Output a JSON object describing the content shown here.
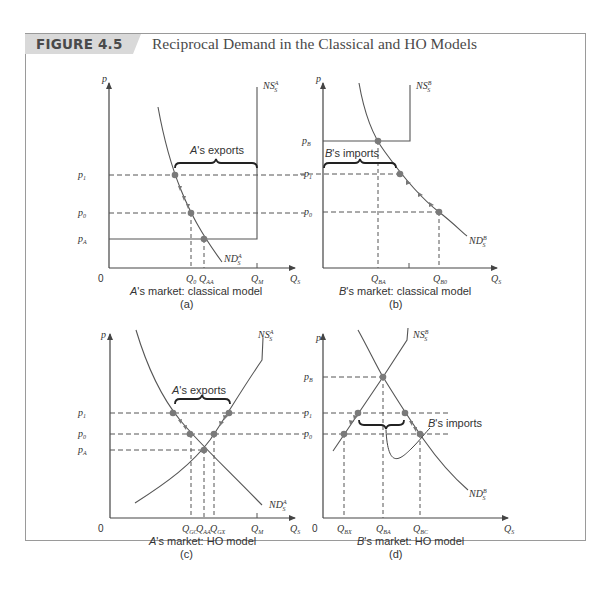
{
  "figure": {
    "number": "FIGURE 4.5",
    "title": "Reciprocal Demand in the Classical and HO Models"
  },
  "panels": [
    {
      "id": "a",
      "caption": "A's market: classical model",
      "caption_prefix": "A",
      "caption_rest": "'s market: classical model",
      "letter": "(a)",
      "y_axis": "p",
      "x_axis": "Q_S",
      "origin": "0",
      "price_labels": [
        "p1",
        "p0",
        "pA"
      ],
      "quantity_labels": [
        "Q0",
        "QAA",
        "QM"
      ],
      "curves": [
        "NS_S^A",
        "ND_S^A"
      ],
      "annotation": "A's exports"
    },
    {
      "id": "b",
      "caption": "B's market: classical model",
      "caption_prefix": "B",
      "caption_rest": "'s market: classical model",
      "letter": "(b)",
      "y_axis": "p",
      "x_axis": "Q_S",
      "price_labels": [
        "pB",
        "p1",
        "p0"
      ],
      "quantity_labels": [
        "QBA",
        "QB0"
      ],
      "curves": [
        "NS_S^B",
        "ND_S^B"
      ],
      "annotation": "B's imports"
    },
    {
      "id": "c",
      "caption": "A's market: HO model",
      "caption_prefix": "A",
      "caption_rest": "'s market: HO model",
      "letter": "(c)",
      "y_axis": "p",
      "x_axis": "Q_S",
      "origin": "0",
      "price_labels": [
        "p1",
        "p0",
        "pA"
      ],
      "quantity_labels": [
        "QGC",
        "QAA",
        "QGX",
        "QM"
      ],
      "curves": [
        "NS_S^A",
        "ND_S^A"
      ],
      "annotation": "A's exports"
    },
    {
      "id": "d",
      "caption": "B's market: HO model",
      "caption_prefix": "B",
      "caption_rest": "'s market: HO model",
      "letter": "(d)",
      "y_axis": "p",
      "x_axis": "Q_S",
      "origin": "0",
      "price_labels": [
        "pB",
        "p1",
        "p0"
      ],
      "quantity_labels": [
        "QBX",
        "QBA",
        "QBC"
      ],
      "curves": [
        "NS_S^B",
        "ND_S^B"
      ],
      "annotation": "B's imports"
    }
  ],
  "text": {
    "p": "p",
    "zero": "0",
    "Q": "Q",
    "S": "S",
    "NS": "NS",
    "ND": "ND",
    "supA": "A",
    "supB": "B",
    "sub1": "1",
    "sub0": "0",
    "subA": "A",
    "subB": "B",
    "subAA": "AA",
    "subM": "M",
    "subBA": "BA",
    "subB0": "B0",
    "subGC": "GC",
    "subGX": "GX",
    "subBX": "BX",
    "subBC": "BC",
    "exportsA_pre": "A",
    "exports_rest": "'s exports",
    "importsB_pre": "B",
    "imports_rest": "'s imports"
  },
  "colors": {
    "line": "#555555",
    "dot": "#7a7a7a",
    "header_tab": "#d9d9d9",
    "frame": "#9a9a9a"
  }
}
